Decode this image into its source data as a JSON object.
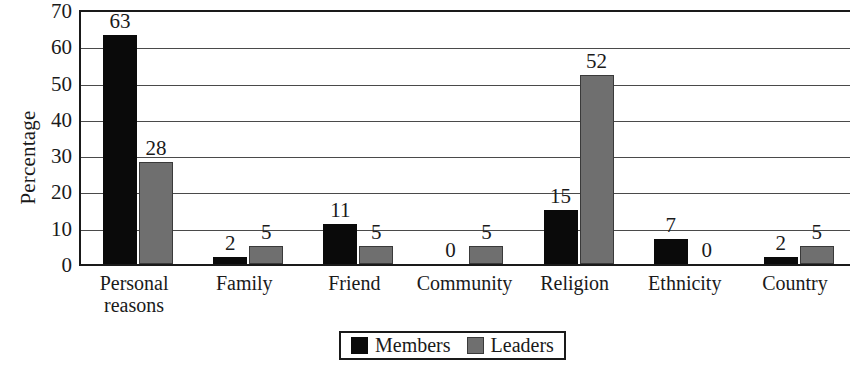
{
  "chart_data": {
    "type": "bar",
    "title": "",
    "xlabel": "",
    "ylabel": "Percentage",
    "ylim": [
      0,
      70
    ],
    "ytick_step": 10,
    "yticks": [
      0,
      10,
      20,
      30,
      40,
      50,
      60,
      70
    ],
    "grid": true,
    "legend_position": "bottom-center",
    "categories": [
      "Personal\nreasons",
      "Family",
      "Friend",
      "Community",
      "Religion",
      "Ethnicity",
      "Country"
    ],
    "series": [
      {
        "name": "Members",
        "color": "#0a0a0a",
        "values": [
          63,
          2,
          11,
          0,
          15,
          7,
          2
        ]
      },
      {
        "name": "Leaders",
        "color": "#6f6f6f",
        "values": [
          28,
          5,
          5,
          5,
          52,
          0,
          5
        ]
      }
    ],
    "data_labels_shown": true
  },
  "axis": {
    "y_title": "Percentage",
    "tick_labels": [
      "70",
      "60",
      "50",
      "40",
      "30",
      "20",
      "10",
      "0"
    ]
  },
  "legend": {
    "items": [
      {
        "label": "Members",
        "swatch": "black-square-swatch"
      },
      {
        "label": "Leaders",
        "swatch": "gray-square-swatch"
      }
    ]
  }
}
